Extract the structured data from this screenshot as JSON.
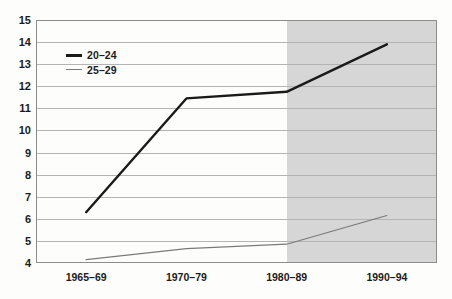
{
  "chart_data": {
    "type": "line",
    "title": "",
    "subtitle": "",
    "xlabel": "",
    "ylabel": "",
    "categories": [
      "1965–69",
      "1970–79",
      "1980–89",
      "1990–94"
    ],
    "ylim": [
      4,
      15
    ],
    "ytick_step": 1,
    "yticks": [
      "15",
      "14",
      "13",
      "12",
      "11",
      "10",
      "9",
      "8",
      "7",
      "6",
      "5",
      "4"
    ],
    "grid": true,
    "grid_axis": "y",
    "legend_position": "top-left-inside",
    "series": [
      {
        "name": "20–24",
        "color": "#1a1a1a",
        "line_width": 2.4,
        "values": [
          6.3,
          11.45,
          11.75,
          13.9
        ]
      },
      {
        "name": "25–29",
        "color": "#7a7a7a",
        "line_width": 1.2,
        "values": [
          4.15,
          4.65,
          4.85,
          6.15
        ]
      }
    ],
    "annotations": [
      {
        "kind": "shaded-band",
        "label": "",
        "x_start_category_fraction": 2.5,
        "x_end_category_fraction": 4.0,
        "color": "#d6d6d6"
      }
    ]
  },
  "axes": {
    "frame_color": "#8c8c8c",
    "gridline_color": "#b4b4b4",
    "tick_label_color": "#1b1b1b"
  },
  "background": {
    "page_color": "#fdfdfc"
  }
}
